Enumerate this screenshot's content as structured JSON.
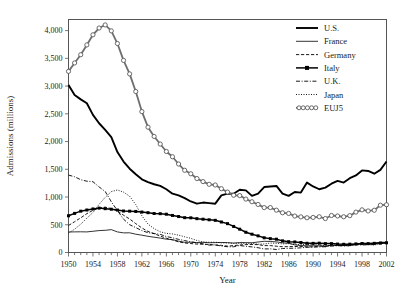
{
  "chart_data": {
    "type": "line",
    "title": "",
    "xlabel": "Year",
    "ylabel": "Admissions (millions)",
    "xlim": [
      1950,
      2002
    ],
    "ylim": [
      0,
      4200
    ],
    "yticks": [
      0,
      500,
      1000,
      1500,
      2000,
      2500,
      3000,
      3500,
      4000
    ],
    "ytick_labels": [
      "0",
      "500",
      "1,000",
      "1,500",
      "2,000",
      "2,500",
      "3,000",
      "3,500",
      "4,000"
    ],
    "xticks": [
      1950,
      1954,
      1958,
      1962,
      1966,
      1970,
      1974,
      1978,
      1982,
      1986,
      1990,
      1994,
      1998,
      2002
    ],
    "xtick_labels": [
      "1950",
      "1954",
      "1958",
      "1962",
      "1966",
      "1970",
      "1974",
      "1978",
      "1982",
      "1986",
      "1990",
      "1994",
      "1998",
      "2002"
    ],
    "minor_xtick_interval": 1,
    "grid": false,
    "legend_position": "top-right",
    "x": [
      1950,
      1951,
      1952,
      1953,
      1954,
      1955,
      1956,
      1957,
      1958,
      1959,
      1960,
      1961,
      1962,
      1963,
      1964,
      1965,
      1966,
      1967,
      1968,
      1969,
      1970,
      1971,
      1972,
      1973,
      1974,
      1975,
      1976,
      1977,
      1978,
      1979,
      1980,
      1981,
      1982,
      1983,
      1984,
      1985,
      1986,
      1987,
      1988,
      1989,
      1990,
      1991,
      1992,
      1993,
      1994,
      1995,
      1996,
      1997,
      1998,
      1999,
      2000,
      2001,
      2002
    ],
    "series": [
      {
        "name": "U.S.",
        "style": "solid-thick",
        "color": "#000000",
        "values": [
          3018,
          2840,
          2760,
          2690,
          2480,
          2330,
          2210,
          2080,
          1810,
          1640,
          1510,
          1410,
          1320,
          1270,
          1230,
          1200,
          1140,
          1060,
          1030,
          980,
          920,
          880,
          900,
          890,
          880,
          1030,
          1060,
          1060,
          1130,
          1120,
          1020,
          1060,
          1180,
          1190,
          1200,
          1060,
          1020,
          1090,
          1080,
          1260,
          1190,
          1140,
          1170,
          1240,
          1290,
          1260,
          1340,
          1390,
          1480,
          1470,
          1420,
          1490,
          1640
        ]
      },
      {
        "name": "France",
        "style": "solid-thin",
        "color": "#000000",
        "values": [
          370,
          372,
          373,
          371,
          383,
          395,
          400,
          412,
          371,
          354,
          355,
          330,
          312,
          292,
          276,
          260,
          240,
          232,
          205,
          184,
          185,
          178,
          184,
          176,
          178,
          181,
          178,
          170,
          179,
          178,
          175,
          189,
          202,
          199,
          191,
          175,
          168,
          137,
          125,
          121,
          122,
          118,
          116,
          132,
          126,
          130,
          137,
          149,
          170,
          155,
          166,
          186,
          185
        ]
      },
      {
        "name": "Germany",
        "style": "dashed",
        "color": "#000000",
        "values": [
          487,
          555,
          625,
          700,
          760,
          801,
          818,
          790,
          750,
          672,
          604,
          520,
          442,
          380,
          340,
          295,
          258,
          226,
          192,
          172,
          161,
          152,
          150,
          144,
          135,
          129,
          115,
          124,
          135,
          143,
          144,
          142,
          124,
          125,
          113,
          104,
          106,
          108,
          108,
          101,
          102,
          120,
          106,
          131,
          133,
          124,
          133,
          144,
          149,
          149,
          153,
          178,
          164
        ]
      },
      {
        "name": "Italy",
        "style": "solid-squares",
        "color": "#000000",
        "values": [
          662,
          705,
          745,
          766,
          785,
          800,
          790,
          780,
          765,
          748,
          745,
          740,
          729,
          718,
          703,
          700,
          690,
          668,
          648,
          628,
          625,
          610,
          600,
          590,
          580,
          550,
          520,
          470,
          420,
          365,
          330,
          300,
          265,
          250,
          240,
          210,
          195,
          190,
          180,
          166,
          165,
          168,
          160,
          160,
          152,
          148,
          150,
          155,
          162,
          160,
          165,
          170,
          175
        ]
      },
      {
        "name": "U.K.",
        "style": "dashdot",
        "color": "#000000",
        "values": [
          1396,
          1365,
          1312,
          1285,
          1276,
          1182,
          1100,
          915,
          754,
          601,
          501,
          449,
          395,
          357,
          342,
          327,
          288,
          265,
          237,
          215,
          193,
          176,
          156,
          134,
          138,
          116,
          104,
          103,
          126,
          112,
          101,
          86,
          64,
          66,
          54,
          72,
          75,
          78,
          84,
          95,
          97,
          100,
          104,
          114,
          124,
          115,
          124,
          139,
          135,
          140,
          143,
          156,
          176
        ]
      },
      {
        "name": "Japan",
        "style": "dotted",
        "color": "#000000",
        "values": [
          350,
          420,
          510,
          620,
          720,
          868,
          994,
          1098,
          1127,
          1088,
          1014,
          863,
          662,
          512,
          431,
          373,
          345,
          335,
          313,
          283,
          255,
          217,
          188,
          185,
          186,
          174,
          172,
          165,
          166,
          165,
          165,
          149,
          154,
          170,
          165,
          155,
          160,
          144,
          145,
          143,
          146,
          138,
          126,
          130,
          123,
          127,
          120,
          141,
          153,
          145,
          135,
          163,
          161
        ]
      },
      {
        "name": "EUJ5",
        "style": "circle-chain",
        "color": "#6e6e6e",
        "values": [
          3265,
          3417,
          3565,
          3742,
          3924,
          4046,
          4102,
          3995,
          3767,
          3463,
          3219,
          2902,
          2540,
          2259,
          2092,
          1955,
          1821,
          1726,
          1595,
          1482,
          1419,
          1333,
          1278,
          1229,
          1217,
          1150,
          1089,
          1032,
          1026,
          963,
          915,
          866,
          809,
          810,
          763,
          716,
          704,
          657,
          642,
          626,
          632,
          644,
          612,
          667,
          658,
          644,
          664,
          728,
          769,
          749,
          762,
          853,
          861
        ]
      }
    ]
  },
  "legend": {
    "items": [
      {
        "label": "U.S.",
        "icon": "line-solid-thick-swatch"
      },
      {
        "label": "France",
        "icon": "line-solid-thin-swatch"
      },
      {
        "label": "Germany",
        "icon": "line-dashed-swatch"
      },
      {
        "label": "Italy",
        "icon": "line-square-marker-swatch"
      },
      {
        "label": "U.K.",
        "icon": "line-dashdot-swatch"
      },
      {
        "label": "Japan",
        "icon": "line-dotted-swatch"
      },
      {
        "label": "EUJ5",
        "icon": "line-circle-chain-swatch"
      }
    ]
  }
}
